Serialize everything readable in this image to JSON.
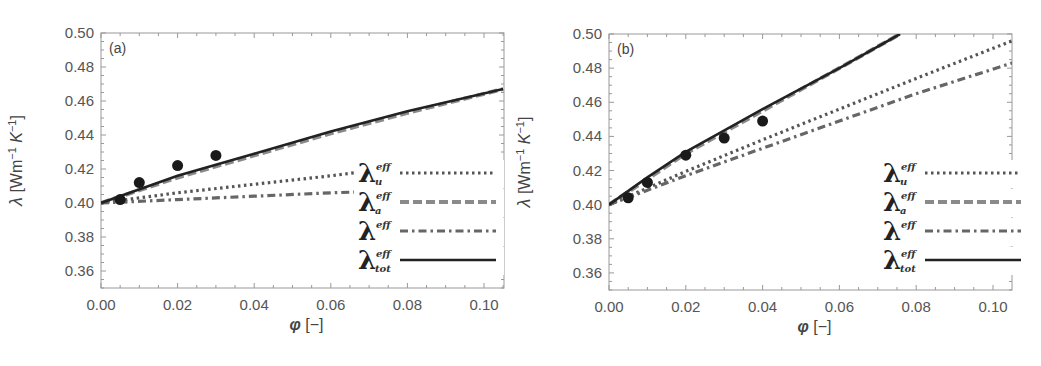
{
  "chart_data": [
    {
      "type": "line",
      "panel_label": "(a)",
      "title": "",
      "xlabel": "φ [−]",
      "ylabel": "λ [Wm⁻¹ K⁻¹]",
      "xlim": [
        0.0,
        0.105
      ],
      "ylim": [
        0.35,
        0.5
      ],
      "xticks": [
        "0.00",
        "0.02",
        "0.04",
        "0.06",
        "0.08",
        "0.10"
      ],
      "yticks": [
        "0.36",
        "0.38",
        "0.40",
        "0.42",
        "0.44",
        "0.46",
        "0.48",
        "0.50"
      ],
      "grid": false,
      "legend_position": "lower right",
      "series": [
        {
          "name": "λ_u^eff",
          "style": "dotted",
          "x": [
            0.0,
            0.02,
            0.04,
            0.06,
            0.067
          ],
          "y": [
            0.4,
            0.406,
            0.411,
            0.416,
            0.418
          ]
        },
        {
          "name": "λ_a^eff",
          "style": "dashed",
          "x": [
            0.0,
            0.02,
            0.04,
            0.06,
            0.08,
            0.105
          ],
          "y": [
            0.4,
            0.415,
            0.428,
            0.441,
            0.453,
            0.467
          ]
        },
        {
          "name": "λ^eff",
          "style": "dash-dot",
          "x": [
            0.0,
            0.02,
            0.04,
            0.06,
            0.067
          ],
          "y": [
            0.4,
            0.402,
            0.404,
            0.406,
            0.4065
          ]
        },
        {
          "name": "λ_tot^eff",
          "style": "solid",
          "x": [
            0.0,
            0.02,
            0.04,
            0.06,
            0.08,
            0.105
          ],
          "y": [
            0.4,
            0.416,
            0.429,
            0.442,
            0.454,
            0.467
          ]
        },
        {
          "name": "measured",
          "style": "markers",
          "x": [
            0.005,
            0.01,
            0.02,
            0.03
          ],
          "y": [
            0.402,
            0.412,
            0.422,
            0.428
          ]
        }
      ]
    },
    {
      "type": "line",
      "panel_label": "(b)",
      "title": "",
      "xlabel": "φ [−]",
      "ylabel": "λ [Wm⁻¹ K⁻¹]",
      "xlim": [
        0.0,
        0.105
      ],
      "ylim": [
        0.35,
        0.5
      ],
      "xticks": [
        "0.00",
        "0.02",
        "0.04",
        "0.06",
        "0.08",
        "0.10"
      ],
      "yticks": [
        "0.36",
        "0.38",
        "0.40",
        "0.42",
        "0.44",
        "0.46",
        "0.48",
        "0.50"
      ],
      "grid": false,
      "legend_position": "lower right",
      "series": [
        {
          "name": "λ_u^eff",
          "style": "dotted",
          "x": [
            0.0,
            0.02,
            0.04,
            0.06,
            0.08,
            0.105
          ],
          "y": [
            0.4,
            0.4195,
            0.438,
            0.456,
            0.474,
            0.496
          ]
        },
        {
          "name": "λ_a^eff",
          "style": "dashed",
          "x": [
            0.0,
            0.02,
            0.04,
            0.06,
            0.0758
          ],
          "y": [
            0.4,
            0.43,
            0.455,
            0.48,
            0.5
          ]
        },
        {
          "name": "λ^eff",
          "style": "dash-dot",
          "x": [
            0.0,
            0.02,
            0.04,
            0.06,
            0.08,
            0.105
          ],
          "y": [
            0.4,
            0.417,
            0.433,
            0.449,
            0.465,
            0.483
          ]
        },
        {
          "name": "λ_tot^eff",
          "style": "solid",
          "x": [
            0.0,
            0.01,
            0.02,
            0.04,
            0.06,
            0.0758
          ],
          "y": [
            0.4,
            0.416,
            0.431,
            0.456,
            0.48,
            0.5
          ]
        },
        {
          "name": "measured",
          "style": "markers",
          "x": [
            0.005,
            0.01,
            0.02,
            0.03,
            0.04
          ],
          "y": [
            0.404,
            0.413,
            0.429,
            0.439,
            0.449
          ]
        }
      ]
    }
  ],
  "legend": [
    {
      "base": "λ",
      "sup": "eff",
      "sub": "u",
      "style": "dotted"
    },
    {
      "base": "λ",
      "sup": "eff",
      "sub": "a",
      "style": "dashed"
    },
    {
      "base": "λ",
      "sup": "eff",
      "sub": "",
      "style": "dash-dot"
    },
    {
      "base": "λ",
      "sup": "eff",
      "sub": "tot",
      "style": "solid"
    }
  ],
  "colors": {
    "solid": "#222222",
    "dashed": "#8a8a8a",
    "dotted": "#555555",
    "dashdot": "#666666",
    "axis": "#999999",
    "marker": "#1a1a1a"
  }
}
